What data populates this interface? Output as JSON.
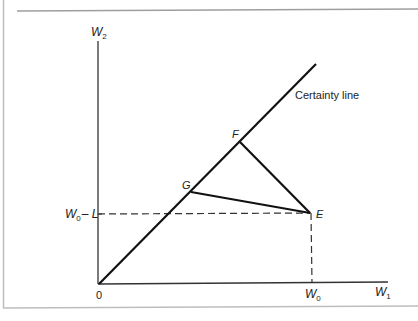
{
  "diagram": {
    "type": "state-contingent wealth diagram",
    "colors": {
      "frame": "#b8b8b8",
      "axes": "#333333",
      "lines": "#111111",
      "dashed": "#333333",
      "text": "#222222"
    },
    "axes": {
      "y_label_main": "W",
      "y_label_sub": "2",
      "x_label_main": "W",
      "x_label_sub": "1",
      "origin_label": "0"
    },
    "ticks": {
      "x_tick_main": "W",
      "x_tick_sub": "0",
      "y_tick_main": "W",
      "y_tick_sub": "0",
      "y_tick_suffix": "– L"
    },
    "certainty_line_label": "Certainty line",
    "points": {
      "E": "E",
      "F": "F",
      "G": "G"
    }
  }
}
